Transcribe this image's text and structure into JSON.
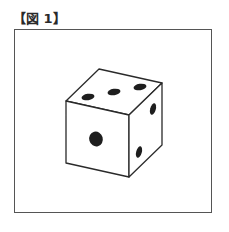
{
  "figure": {
    "title": "【図 1】"
  },
  "die": {
    "description": "Cube (die) drawn in perspective",
    "visible_faces": {
      "top": {
        "pips": 3
      },
      "front": {
        "pips": 1
      },
      "right": {
        "pips": 2
      }
    },
    "colors": {
      "edge": "#2a2a2a",
      "pip": "#1e1e1e",
      "face": "#ffffff",
      "frame": "#555555"
    }
  }
}
